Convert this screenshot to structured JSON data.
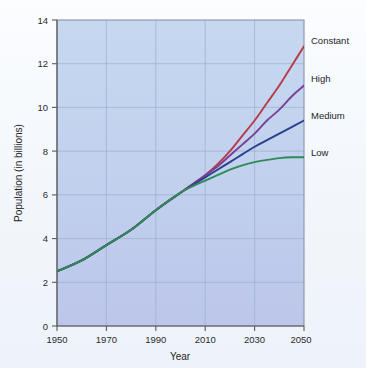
{
  "chart_data": {
    "type": "line",
    "title": "",
    "xlabel": "Year",
    "ylabel": "Population (in billions)",
    "xlim": [
      1950,
      2050
    ],
    "ylim": [
      0,
      14
    ],
    "xticks": [
      1950,
      1970,
      1990,
      2010,
      2030,
      2050
    ],
    "yticks": [
      0,
      2,
      4,
      6,
      8,
      10,
      12,
      14
    ],
    "grid": true,
    "legend_position": "right-inline-labels",
    "x": [
      1950,
      1960,
      1970,
      1980,
      1990,
      2000,
      2005,
      2010,
      2015,
      2020,
      2025,
      2030,
      2035,
      2040,
      2045,
      2050
    ],
    "series": [
      {
        "name": "Constant",
        "color": "#b83a4b",
        "values": [
          2.5,
          3.0,
          3.7,
          4.4,
          5.3,
          6.1,
          6.5,
          6.9,
          7.4,
          8.0,
          8.7,
          9.4,
          10.2,
          11.0,
          11.9,
          12.8
        ]
      },
      {
        "name": "High",
        "color": "#7a3f96",
        "values": [
          2.5,
          3.0,
          3.7,
          4.4,
          5.3,
          6.1,
          6.5,
          6.9,
          7.3,
          7.8,
          8.3,
          8.8,
          9.4,
          9.9,
          10.5,
          11.0
        ]
      },
      {
        "name": "Medium",
        "color": "#2b3f8c",
        "values": [
          2.5,
          3.0,
          3.7,
          4.4,
          5.3,
          6.1,
          6.45,
          6.8,
          7.15,
          7.5,
          7.85,
          8.2,
          8.5,
          8.8,
          9.1,
          9.4
        ]
      },
      {
        "name": "Low",
        "color": "#2e8b57",
        "values": [
          2.5,
          3.0,
          3.7,
          4.4,
          5.3,
          6.1,
          6.4,
          6.65,
          6.9,
          7.15,
          7.35,
          7.5,
          7.6,
          7.68,
          7.72,
          7.72
        ]
      }
    ]
  },
  "axes": {
    "y_tick_labels": [
      "0",
      "2",
      "4",
      "6",
      "8",
      "10",
      "12",
      "14"
    ],
    "x_tick_labels": [
      "1950",
      "1970",
      "1990",
      "2010",
      "2030",
      "2050"
    ],
    "x_title": "Year",
    "y_title": "Population (in billions)"
  },
  "legend": {
    "items": [
      {
        "label": "Constant",
        "color": "#b83a4b"
      },
      {
        "label": "High",
        "color": "#7a3f96"
      },
      {
        "label": "Medium",
        "color": "#2b3f8c"
      },
      {
        "label": "Low",
        "color": "#2e8b57"
      }
    ]
  },
  "colors": {
    "plot_background_top": "#c3d6ef",
    "plot_background_bottom": "#bfc8ec",
    "grid": "#9fb4d2",
    "axis": "#6b6b6b",
    "page_background": "#f6f9fc"
  }
}
